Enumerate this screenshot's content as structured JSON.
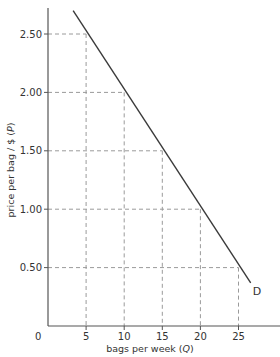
{
  "chart_data": {
    "type": "line",
    "title": "",
    "xlabel": "bags per week (Q)",
    "ylabel": "price per bag / $ (P)",
    "xlabel_parts": {
      "text": "bags per week (",
      "var": "Q",
      "close": ")"
    },
    "ylabel_parts": {
      "text": "price per bag / $ (",
      "var": "P",
      "close": ")"
    },
    "origin_label": "0",
    "x_ticks": [
      5,
      10,
      15,
      20,
      25
    ],
    "x_tick_labels": [
      "5",
      "10",
      "15",
      "20",
      "25"
    ],
    "y_ticks": [
      0.5,
      1.0,
      1.5,
      2.0,
      2.5
    ],
    "y_tick_labels": [
      "0.50",
      "1.00",
      "1.50",
      "2.00",
      "2.50"
    ],
    "xlim": [
      0,
      30
    ],
    "ylim": [
      0,
      2.75
    ],
    "grid": false,
    "guide_lines": "dashed lines from each labelled point on D to both axes",
    "series": [
      {
        "name": "D",
        "label": "D",
        "x": [
          5,
          10,
          15,
          20,
          25
        ],
        "y": [
          2.5,
          2.0,
          1.5,
          1.0,
          0.5
        ],
        "line_start": [
          3.3,
          2.7
        ],
        "line_end": [
          26.6,
          0.37
        ]
      }
    ],
    "legend": "none (curve labelled D at end)"
  },
  "colors": {
    "axis": "#555555",
    "curve": "#3a3a3a",
    "guide": "#9a9a9a",
    "text": "#333333"
  }
}
